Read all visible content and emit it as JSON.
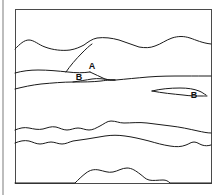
{
  "figure": {
    "kind": "geologic-cross-section",
    "title": "",
    "frame": {
      "stroke_color": "#4a4a4a",
      "stroke_width": 1,
      "fill_color": "#ffffff",
      "x": 15,
      "y": 9,
      "width": 196,
      "height": 174
    },
    "page_edge_line": {
      "color": "#bdbdbd",
      "x": 3,
      "y1": 0,
      "y2": 195,
      "width": 2
    },
    "line_style": {
      "stroke_color": "#1a1a1a",
      "stroke_width": 1,
      "fill": "none"
    },
    "labels": [
      {
        "id": "label-a",
        "text": "A",
        "x": 92,
        "y": 69
      },
      {
        "id": "label-b-left",
        "text": "B",
        "x": 79,
        "y": 80
      },
      {
        "id": "label-b-right",
        "text": "B",
        "x": 194,
        "y": 98
      }
    ],
    "horizons": [
      {
        "id": "horizon-1-upper-contact",
        "name": "upper undulating horizon",
        "path": "M15,49 C20,44 24,40 29,40 C34,40 39,45 45,47 C53,50 62,51 70,50 C76,49 80,47 84,45 C88,42 92,39 97,38 C104,37 112,38 119,40 C126,42 132,45 139,47 C145,48 150,48 155,46 C161,44 166,40 172,38 C178,36 184,36 190,38 C196,40 202,43 211,44"
      },
      {
        "id": "horizon-2-left-contact",
        "name": "second horizon left segment with fault splay",
        "path": "M15,73 C22,71 30,70 38,70 C48,70 58,71 68,72 C76,73 83,73 90,72"
      },
      {
        "id": "fault-splay",
        "name": "inclined fault / unconformity splay",
        "path": "M66,72 C70,66 76,59 82,53 C86,49 89,46 92,44"
      },
      {
        "id": "wedge-upper-limb",
        "name": "wedge upper limb to pinch-out",
        "path": "M90,72 C95,74 100,77 105,79 C109,80 112,80 115,80"
      },
      {
        "id": "horizon-3-lower-contact",
        "name": "third horizon passing through wedge base",
        "path": "M15,89 C23,87 32,85 41,84 C52,83 63,82 73,82 C83,82 92,82 101,81 C108,80 112,80 116,80 C126,79 137,78 148,77 C160,76 172,76 184,76 C194,76 203,76 211,76"
      },
      {
        "id": "wedge-lower-limb",
        "name": "wedge lower limb closing at pinch-out",
        "path": "M73,82 C80,81 86,80 92,79 C98,78 104,79 110,80 C112,80 114,80 115,80"
      },
      {
        "id": "lens-right-upper",
        "name": "thin elongated lens upper boundary",
        "path": "M152,91 C160,89 170,88 180,88 C188,88 194,89 199,91 C202,92 204,94 206,95"
      },
      {
        "id": "lens-right-lower",
        "name": "thin elongated lens lower boundary",
        "path": "M152,91 C162,93 173,94 183,95 C190,96 196,96 202,96 C204,96 205,96 207,96"
      },
      {
        "id": "horizon-4-upper",
        "name": "fourth horizon, crenulated upper bed",
        "path": "M15,130 C20,128 24,127 29,128 C34,129 38,130 43,129 C47,128 51,126 56,127 C60,128 63,130 67,130 C71,130 74,128 78,128 C82,128 85,130 89,130 C93,130 96,128 100,126 C104,124 107,121 111,121 C116,121 119,123 124,123 C131,123 139,122 147,123 C155,124 163,125 171,126 C180,127 189,129 198,131 C203,132 207,133 211,133"
      },
      {
        "id": "horizon-5-lower",
        "name": "fifth horizon, crenulated lower bed",
        "path": "M15,143 C20,141 24,140 29,141 C33,142 36,144 40,144 C44,144 47,142 51,142 C55,142 58,144 62,144 C66,144 69,142 73,141 C78,140 82,140 87,139 C93,138 99,137 105,136 C112,135 118,135 125,136 C133,137 141,139 149,141 C156,143 163,145 170,146 C176,147 181,147 186,145 C189,144 191,142 194,142 C197,142 199,144 202,145 C205,146 208,146 211,145"
      },
      {
        "id": "basal-mound",
        "name": "basal mound / intrusive dome at section floor",
        "path": "M15,183 L75,183 C78,180 82,176 86,173 C90,170 94,169 99,170 C104,171 108,173 113,172 C118,171 122,168 127,168 C132,168 136,171 140,174 C143,176 145,179 149,180 C153,181 158,180 163,180 C166,180 168,181 170,183 L211,183"
      }
    ]
  }
}
